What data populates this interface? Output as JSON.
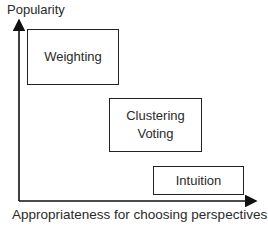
{
  "diagram": {
    "y_axis_label": "Popularity",
    "x_axis_label": "Appropriateness for choosing perspectives",
    "boxes": [
      {
        "lines": [
          "Weighting"
        ]
      },
      {
        "lines": [
          "Clustering",
          "Voting"
        ]
      },
      {
        "lines": [
          "Intuition"
        ]
      }
    ]
  }
}
